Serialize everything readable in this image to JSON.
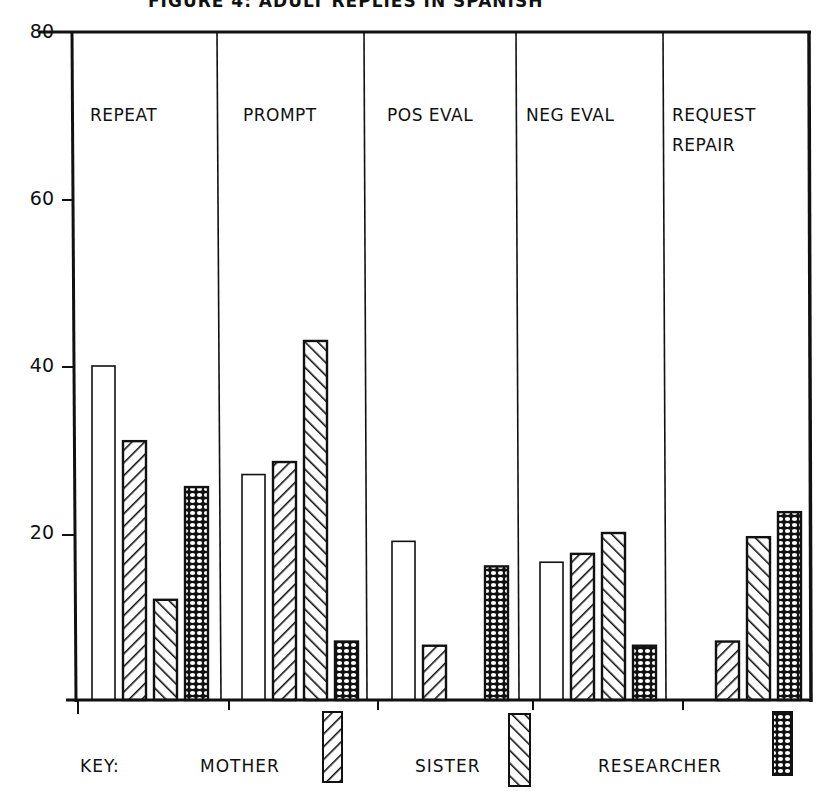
{
  "title": "FIGURE 4: ADULT REPLIES IN SPANISH",
  "colors": {
    "ink": "#111111",
    "background": "#ffffff"
  },
  "y_axis": {
    "ticks": [
      "80",
      "60",
      "40",
      "20"
    ]
  },
  "categories": [
    "REPEAT",
    "PROMPT",
    "POS EVAL",
    "NEG EVAL",
    "REQUEST\nREPAIR"
  ],
  "key": {
    "label": "KEY:",
    "items": [
      {
        "name": "MOTHER",
        "pattern": "diagonal-up"
      },
      {
        "name": "SISTER",
        "pattern": "diagonal-down"
      },
      {
        "name": "RESEARCHER",
        "pattern": "dotted"
      }
    ]
  },
  "chart_data": {
    "type": "bar",
    "title": "FIGURE 4: ADULT REPLIES IN SPANISH",
    "xlabel": "",
    "ylabel": "",
    "ylim": [
      0,
      80
    ],
    "yticks": [
      20,
      40,
      60,
      80
    ],
    "grid": false,
    "legend_position": "bottom",
    "categories": [
      "REPEAT",
      "PROMPT",
      "POS EVAL",
      "NEG EVAL",
      "REQUEST REPAIR"
    ],
    "series": [
      {
        "name": "(unlabeled / open bar)",
        "pattern": "none",
        "values": [
          40,
          27,
          19,
          16.5,
          0
        ]
      },
      {
        "name": "MOTHER",
        "pattern": "diagonal-up",
        "values": [
          31,
          28.5,
          6.5,
          17.5,
          7
        ]
      },
      {
        "name": "SISTER",
        "pattern": "diagonal-down",
        "values": [
          12,
          43,
          0,
          20,
          19.5
        ]
      },
      {
        "name": "RESEARCHER",
        "pattern": "dotted",
        "values": [
          25.5,
          7,
          16,
          6.5,
          22.5
        ]
      }
    ]
  }
}
